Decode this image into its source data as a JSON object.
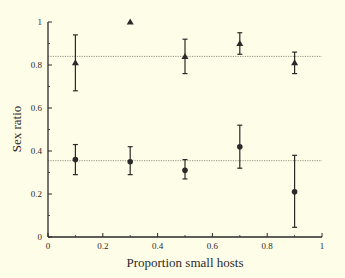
{
  "chart_data": {
    "type": "scatter",
    "title": "",
    "xlabel": "Proportion small hosts",
    "ylabel": "Sex ratio",
    "xlim": [
      0,
      1
    ],
    "ylim": [
      0,
      1
    ],
    "x_ticks": [
      0,
      0.2,
      0.4,
      0.6,
      0.8,
      1
    ],
    "x_tick_labels": [
      "0",
      "0.2",
      "0.4",
      "0.6",
      "0.8",
      "1"
    ],
    "y_ticks": [
      0,
      0.2,
      0.4,
      0.6,
      0.8,
      1
    ],
    "y_tick_labels": [
      "0",
      "0.2",
      "0.4",
      "0.6",
      "0.8",
      "1"
    ],
    "grid": false,
    "legend": null,
    "series": [
      {
        "name": "triangles",
        "marker": "triangle",
        "x": [
          0.1,
          0.3,
          0.5,
          0.7,
          0.9
        ],
        "y": [
          0.81,
          1.0,
          0.84,
          0.9,
          0.81
        ],
        "err_low": [
          0.68,
          null,
          0.76,
          0.85,
          0.76
        ],
        "err_high": [
          0.94,
          null,
          0.92,
          0.95,
          0.86
        ],
        "reference_line": 0.84
      },
      {
        "name": "circles",
        "marker": "circle",
        "x": [
          0.1,
          0.3,
          0.5,
          0.7,
          0.9
        ],
        "y": [
          0.36,
          0.35,
          0.31,
          0.42,
          0.21
        ],
        "err_low": [
          0.29,
          0.29,
          0.27,
          0.32,
          0.045
        ],
        "err_high": [
          0.43,
          0.42,
          0.36,
          0.52,
          0.38
        ],
        "reference_line": 0.355
      }
    ]
  },
  "colors": {
    "background": "#fefde8",
    "ink": "#2a2a2a",
    "reference_line": "#7a7a6a"
  }
}
